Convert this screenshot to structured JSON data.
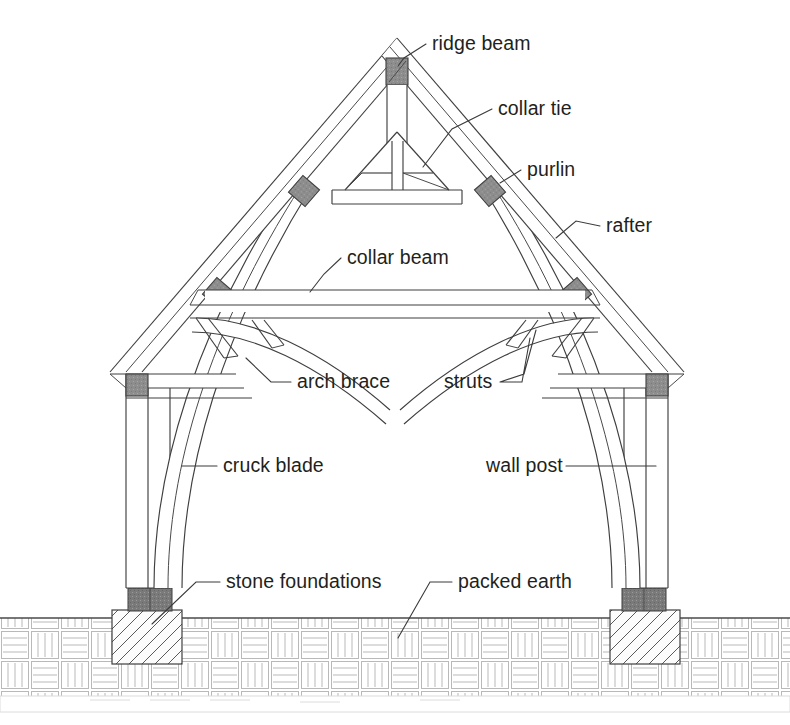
{
  "diagram": {
    "type": "architectural-line-drawing",
    "background_color": "#ffffff",
    "line_color": "#3f3f3f",
    "joint_color": "#8d8d8d",
    "plinth_color": "#777777",
    "ground_hatch_color": "#b9b9b9",
    "text_color": "#231f20"
  },
  "labels": [
    {
      "id": "ridge-beam",
      "text": "ridge beam",
      "x": 432,
      "y": 50,
      "align": "start",
      "leader": "M 426 44 L 404 58 L 398 66"
    },
    {
      "id": "collar-tie",
      "text": "collar tie",
      "x": 498,
      "y": 115,
      "align": "start",
      "leader": "M 492 109 L 452 129 L 423 167"
    },
    {
      "id": "purlin",
      "text": "purlin",
      "x": 527,
      "y": 176,
      "align": "start",
      "leader": "M 521 170 L 500 183"
    },
    {
      "id": "rafter",
      "text": "rafter",
      "x": 606,
      "y": 232,
      "align": "start",
      "leader": "M 600 226 L 576 221 L 556 238"
    },
    {
      "id": "collar-beam",
      "text": "collar beam",
      "x": 347,
      "y": 264,
      "align": "start",
      "leader": "M 341 258 L 324 274 L 310 292"
    },
    {
      "id": "arch-brace",
      "text": "arch brace",
      "x": 297,
      "y": 388,
      "align": "start",
      "leader": "M 291 382 L 271 382 L 246 358"
    },
    {
      "id": "struts",
      "text": "struts",
      "x": 444,
      "y": 388,
      "align": "start",
      "leader": "M 500 382 L 522 382 L 530 338 M 500 382 L 524 374 L 536 330"
    },
    {
      "id": "cruck-blade",
      "text": "cruck blade",
      "x": 223,
      "y": 472,
      "align": "start",
      "leader": "M 217 466 L 182 466"
    },
    {
      "id": "wall-post",
      "text": "wall post",
      "x": 486,
      "y": 472,
      "align": "start",
      "leader": "M 566 466 L 656 466"
    },
    {
      "id": "stone-foundations",
      "text": "stone foundations",
      "x": 226,
      "y": 588,
      "align": "start",
      "leader": "M 220 582 L 196 582 L 152 624"
    },
    {
      "id": "packed-earth",
      "text": "packed earth",
      "x": 458,
      "y": 588,
      "align": "start",
      "leader": "M 452 582 L 430 582 L 398 638"
    }
  ],
  "geometry": {
    "apex_x": 397,
    "apex_y": 38,
    "ground_y": 618,
    "left_post_x": 126,
    "right_post_x": 668,
    "ridge_beam_block": {
      "x": 386,
      "y": 58,
      "w": 22,
      "h": 27
    },
    "purlin_blocks": [
      {
        "x": 296,
        "y": 184
      },
      {
        "x": 484,
        "y": 184
      },
      {
        "x": 212,
        "y": 286
      },
      {
        "x": 566,
        "y": 286
      }
    ],
    "wall_plate_joints": [
      {
        "x": 124,
        "y": 374
      },
      {
        "x": 648,
        "y": 374
      }
    ],
    "foundations": [
      {
        "x": 112,
        "y": 610,
        "w": 70,
        "h": 54
      },
      {
        "x": 610,
        "y": 610,
        "w": 70,
        "h": 54
      }
    ],
    "plinths": [
      {
        "x": 128,
        "y": 588,
        "w": 44,
        "h": 22
      },
      {
        "x": 622,
        "y": 588,
        "w": 44,
        "h": 22
      }
    ]
  }
}
